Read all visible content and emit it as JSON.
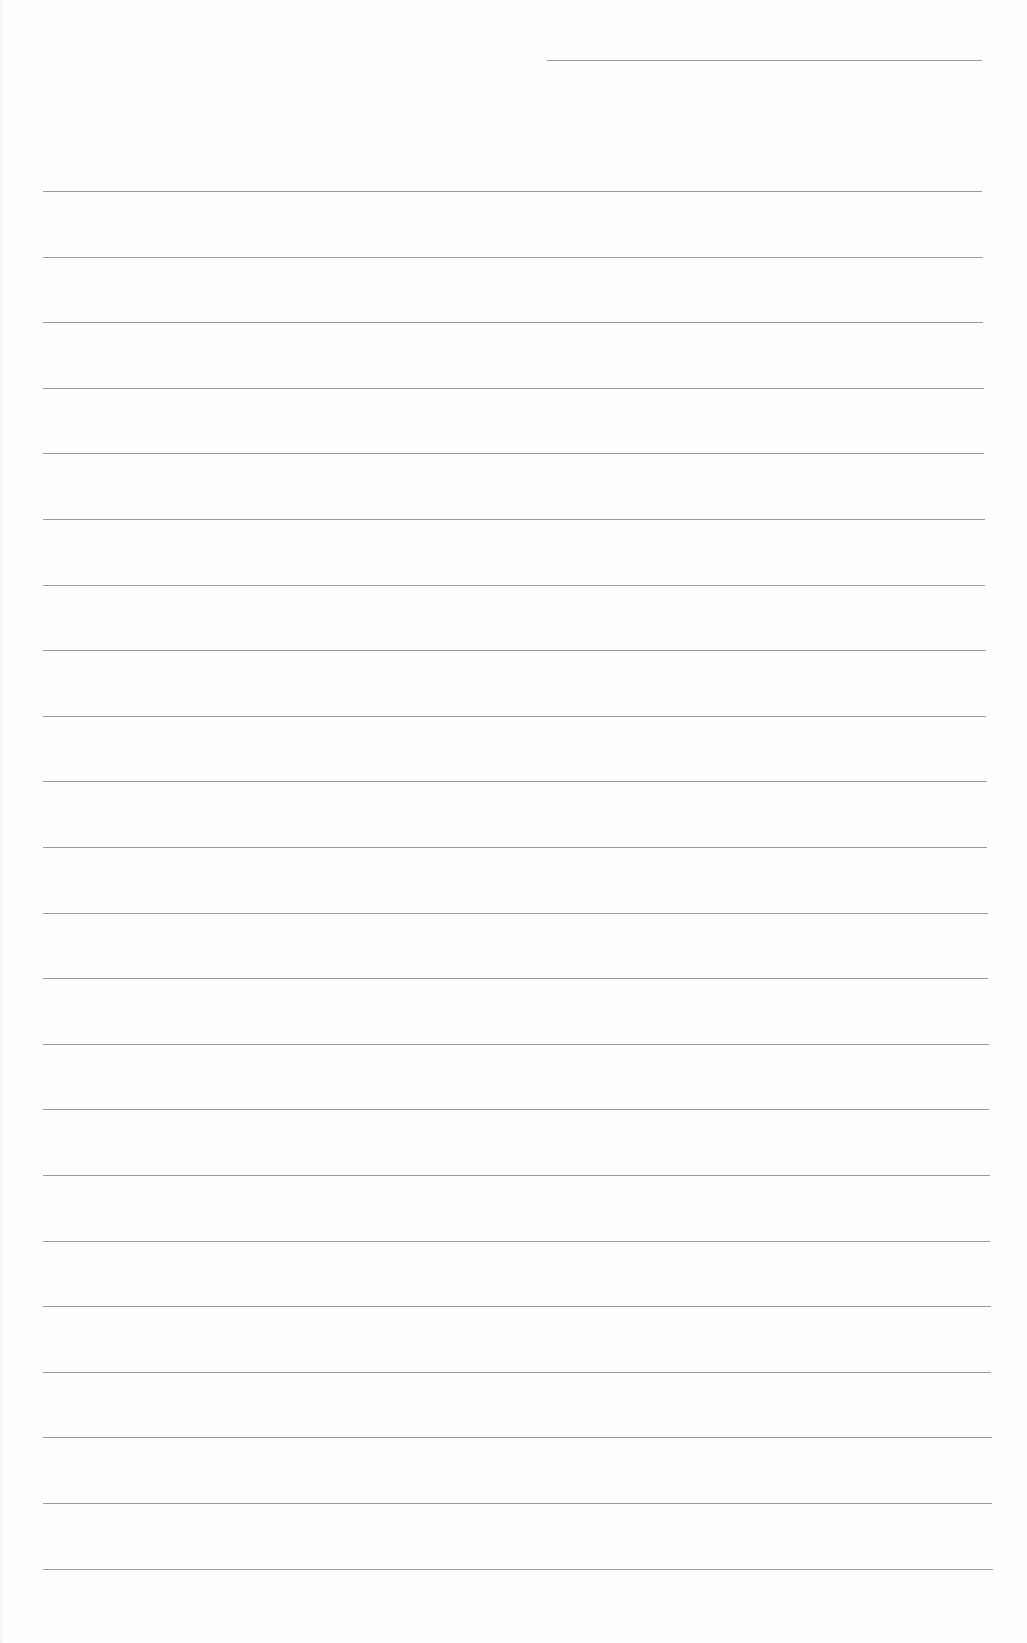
{
  "page": {
    "type": "blank lined paper",
    "background": "#fefefe",
    "rule_color": "#8a8a8a",
    "header_line": {
      "x": 547,
      "y": 60,
      "width": 435
    },
    "rules": {
      "count": 22,
      "start_y": 191,
      "spacing": 65.6,
      "x_start": 43,
      "x_end": 982
    },
    "text": []
  }
}
